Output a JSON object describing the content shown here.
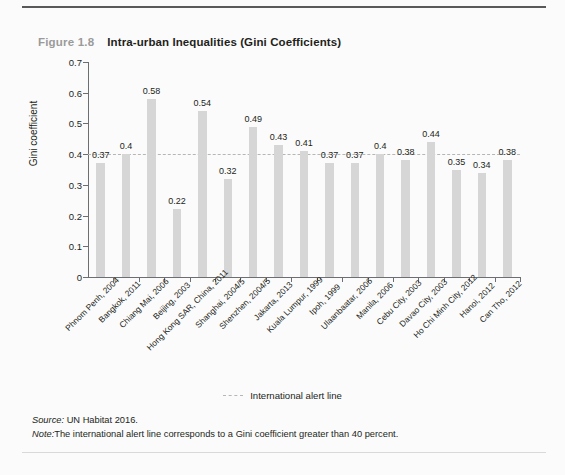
{
  "figure": {
    "number": "Figure 1.8",
    "title": "Intra-urban Inequalities (Gini Coefficients)"
  },
  "legend": {
    "alert_line_label": "International alert line",
    "marker": "dashed-line-icon"
  },
  "footnotes": {
    "source_key": "Source:",
    "source_text": " UN Habitat 2016.",
    "note_key": "Note:",
    "note_text": "The international alert line corresponds to a Gini coefficient greater than 40 percent."
  },
  "colors": {
    "bar": "#d6d6d6",
    "alert_line": "#b6b6b6",
    "axis": "#6d6e71",
    "title": "#231f20",
    "figure_number": "#9a9a9a"
  },
  "chart_data": {
    "type": "bar",
    "title": "Intra-urban Inequalities (Gini Coefficients)",
    "xlabel": "",
    "ylabel": "Gini coefficient",
    "ylim": [
      0,
      0.7
    ],
    "ytick_labels": [
      "0.7",
      "0.6",
      "0.5",
      "0.4",
      "0.3",
      "0.2",
      "0.1",
      "0"
    ],
    "ytick_values": [
      0.7,
      0.6,
      0.5,
      0.4,
      0.3,
      0.2,
      0.1,
      0
    ],
    "grid": false,
    "legend_position": "bottom-center",
    "categories": [
      "Phnom Penh, 2004",
      "Bangkok, 2011",
      "Chiang Mai, 2006",
      "Beijing, 2003",
      "Hong Kong SAR, China, 2011",
      "Shanghai, 2004/5",
      "Shenzhen, 2004/5",
      "Jakarta, 2013",
      "Kuala Lumpur, 1999",
      "Ipoh, 1999",
      "Ulaanbaatar, 2006",
      "Manila, 2006",
      "Cebu City, 2003",
      "Davao City, 2003",
      "Ho Chi Minh City, 2012",
      "Hanoi, 2012",
      "Can Tho, 2012"
    ],
    "values": [
      0.37,
      0.4,
      0.58,
      0.22,
      0.54,
      0.32,
      0.49,
      0.43,
      0.41,
      0.37,
      0.37,
      0.4,
      0.38,
      0.44,
      0.35,
      0.34,
      0.38
    ],
    "value_labels": [
      "0.37",
      "0.4",
      "0.58",
      "0.22",
      "0.54",
      "0.32",
      "0.49",
      "0.43",
      "0.41",
      "0.37",
      "0.37",
      "0.4",
      "0.38",
      "0.44",
      "0.35",
      "0.34",
      "0.38"
    ],
    "annotations": [
      {
        "name": "international-alert-line",
        "type": "hline",
        "value": 0.4,
        "style": "dashed",
        "label": "International alert line"
      }
    ]
  }
}
